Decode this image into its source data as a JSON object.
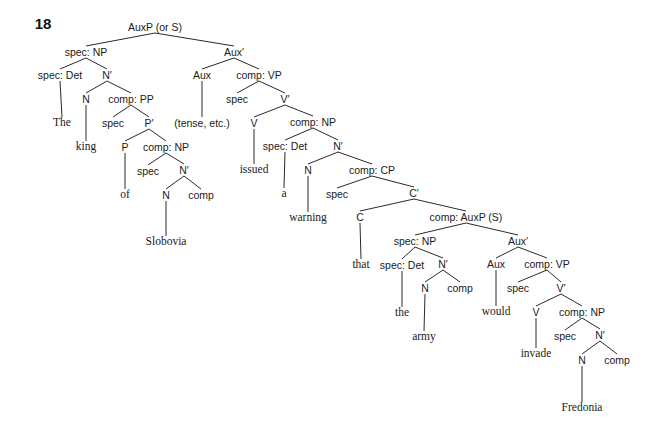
{
  "figure": {
    "number": "18"
  },
  "tree": {
    "nodes": [
      {
        "id": 0,
        "label": "AuxP (or S)",
        "type": "cat",
        "x": 155,
        "y": 27
      },
      {
        "id": 1,
        "label": "spec: NP",
        "type": "cat",
        "x": 86,
        "y": 52
      },
      {
        "id": 2,
        "label": "Aux′",
        "type": "cat",
        "x": 234,
        "y": 52
      },
      {
        "id": 3,
        "label": "spec: Det",
        "type": "cat",
        "x": 60,
        "y": 75
      },
      {
        "id": 4,
        "label": "N′",
        "type": "cat",
        "x": 107,
        "y": 75
      },
      {
        "id": 5,
        "label": "Aux",
        "type": "cat",
        "x": 202,
        "y": 75
      },
      {
        "id": 6,
        "label": "comp: VP",
        "type": "cat",
        "x": 259,
        "y": 75
      },
      {
        "id": 7,
        "label": "The",
        "type": "word",
        "x": 62,
        "y": 123
      },
      {
        "id": 8,
        "label": "N",
        "type": "cat",
        "x": 86,
        "y": 99
      },
      {
        "id": 9,
        "label": "comp: PP",
        "type": "cat",
        "x": 131,
        "y": 99
      },
      {
        "id": 10,
        "label": "(tense, etc.)",
        "type": "cat",
        "x": 202,
        "y": 123
      },
      {
        "id": 11,
        "label": "spec",
        "type": "cat",
        "x": 237,
        "y": 99
      },
      {
        "id": 12,
        "label": "V′",
        "type": "cat",
        "x": 285,
        "y": 99
      },
      {
        "id": 13,
        "label": "king",
        "type": "word",
        "x": 86,
        "y": 147
      },
      {
        "id": 14,
        "label": "spec",
        "type": "cat",
        "x": 113,
        "y": 123
      },
      {
        "id": 15,
        "label": "P′",
        "type": "cat",
        "x": 149,
        "y": 123
      },
      {
        "id": 16,
        "label": "V",
        "type": "cat",
        "x": 254,
        "y": 123
      },
      {
        "id": 17,
        "label": "comp: NP",
        "type": "cat",
        "x": 313,
        "y": 122
      },
      {
        "id": 18,
        "label": "P",
        "type": "cat",
        "x": 125,
        "y": 147
      },
      {
        "id": 19,
        "label": "comp: NP",
        "type": "cat",
        "x": 166,
        "y": 147
      },
      {
        "id": 20,
        "label": "spec: Det",
        "type": "cat",
        "x": 285,
        "y": 146
      },
      {
        "id": 21,
        "label": "N′",
        "type": "cat",
        "x": 338,
        "y": 146
      },
      {
        "id": 22,
        "label": "of",
        "type": "word",
        "x": 125,
        "y": 195
      },
      {
        "id": 23,
        "label": "spec",
        "type": "cat",
        "x": 148,
        "y": 171
      },
      {
        "id": 24,
        "label": "N′",
        "type": "cat",
        "x": 184,
        "y": 170
      },
      {
        "id": 25,
        "label": "issued",
        "type": "word",
        "x": 254,
        "y": 170
      },
      {
        "id": 26,
        "label": "a",
        "type": "word",
        "x": 284,
        "y": 194
      },
      {
        "id": 27,
        "label": "N",
        "type": "cat",
        "x": 308,
        "y": 170
      },
      {
        "id": 28,
        "label": "comp: CP",
        "type": "cat",
        "x": 372,
        "y": 170
      },
      {
        "id": 29,
        "label": "N",
        "type": "cat",
        "x": 166,
        "y": 195
      },
      {
        "id": 30,
        "label": "comp",
        "type": "cat",
        "x": 201,
        "y": 195
      },
      {
        "id": 31,
        "label": "warning",
        "type": "word",
        "x": 308,
        "y": 218
      },
      {
        "id": 32,
        "label": "spec",
        "type": "cat",
        "x": 337,
        "y": 194
      },
      {
        "id": 33,
        "label": "C′",
        "type": "cat",
        "x": 414,
        "y": 193
      },
      {
        "id": 34,
        "label": "Slobovia",
        "type": "word",
        "x": 166,
        "y": 242
      },
      {
        "id": 35,
        "label": "C",
        "type": "cat",
        "x": 360,
        "y": 217
      },
      {
        "id": 36,
        "label": "comp: AuxP (S)",
        "type": "cat",
        "x": 466,
        "y": 217
      },
      {
        "id": 37,
        "label": "that",
        "type": "word",
        "x": 361,
        "y": 265
      },
      {
        "id": 38,
        "label": "spec: NP",
        "type": "cat",
        "x": 415,
        "y": 241
      },
      {
        "id": 39,
        "label": "Aux′",
        "type": "cat",
        "x": 518,
        "y": 241
      },
      {
        "id": 40,
        "label": "spec: Det",
        "type": "cat",
        "x": 402,
        "y": 265
      },
      {
        "id": 41,
        "label": "N′",
        "type": "cat",
        "x": 443,
        "y": 264
      },
      {
        "id": 42,
        "label": "Aux",
        "type": "cat",
        "x": 496,
        "y": 264
      },
      {
        "id": 43,
        "label": "comp: VP",
        "type": "cat",
        "x": 547,
        "y": 264
      },
      {
        "id": 44,
        "label": "the",
        "type": "word",
        "x": 402,
        "y": 313
      },
      {
        "id": 45,
        "label": "N",
        "type": "cat",
        "x": 425,
        "y": 288
      },
      {
        "id": 46,
        "label": "comp",
        "type": "cat",
        "x": 460,
        "y": 288
      },
      {
        "id": 47,
        "label": "would",
        "type": "word",
        "x": 496,
        "y": 312
      },
      {
        "id": 48,
        "label": "spec",
        "type": "cat",
        "x": 518,
        "y": 288
      },
      {
        "id": 49,
        "label": "V′",
        "type": "cat",
        "x": 561,
        "y": 288
      },
      {
        "id": 50,
        "label": "army",
        "type": "word",
        "x": 424,
        "y": 337
      },
      {
        "id": 51,
        "label": "V",
        "type": "cat",
        "x": 536,
        "y": 312
      },
      {
        "id": 52,
        "label": "comp: NP",
        "type": "cat",
        "x": 582,
        "y": 312
      },
      {
        "id": 53,
        "label": "invade",
        "type": "word",
        "x": 536,
        "y": 354
      },
      {
        "id": 54,
        "label": "spec",
        "type": "cat",
        "x": 565,
        "y": 336
      },
      {
        "id": 55,
        "label": "N′",
        "type": "cat",
        "x": 600,
        "y": 335
      },
      {
        "id": 56,
        "label": "N",
        "type": "cat",
        "x": 582,
        "y": 360
      },
      {
        "id": 57,
        "label": "comp",
        "type": "cat",
        "x": 617,
        "y": 360
      },
      {
        "id": 58,
        "label": "Fredonia",
        "type": "word",
        "x": 582,
        "y": 408
      }
    ],
    "edges": [
      [
        0,
        1
      ],
      [
        0,
        2
      ],
      [
        1,
        3
      ],
      [
        1,
        4
      ],
      [
        2,
        5
      ],
      [
        2,
        6
      ],
      [
        3,
        7
      ],
      [
        4,
        8
      ],
      [
        4,
        9
      ],
      [
        5,
        10
      ],
      [
        6,
        11
      ],
      [
        6,
        12
      ],
      [
        8,
        13
      ],
      [
        9,
        14
      ],
      [
        9,
        15
      ],
      [
        12,
        16
      ],
      [
        12,
        17
      ],
      [
        15,
        18
      ],
      [
        15,
        19
      ],
      [
        17,
        20
      ],
      [
        17,
        21
      ],
      [
        18,
        22
      ],
      [
        19,
        23
      ],
      [
        19,
        24
      ],
      [
        16,
        25
      ],
      [
        20,
        26
      ],
      [
        21,
        27
      ],
      [
        21,
        28
      ],
      [
        24,
        29
      ],
      [
        24,
        30
      ],
      [
        27,
        31
      ],
      [
        28,
        32
      ],
      [
        28,
        33
      ],
      [
        29,
        34
      ],
      [
        33,
        35
      ],
      [
        33,
        36
      ],
      [
        35,
        37
      ],
      [
        36,
        38
      ],
      [
        36,
        39
      ],
      [
        38,
        40
      ],
      [
        38,
        41
      ],
      [
        39,
        42
      ],
      [
        39,
        43
      ],
      [
        40,
        44
      ],
      [
        41,
        45
      ],
      [
        41,
        46
      ],
      [
        42,
        47
      ],
      [
        43,
        48
      ],
      [
        43,
        49
      ],
      [
        45,
        50
      ],
      [
        49,
        51
      ],
      [
        49,
        52
      ],
      [
        51,
        53
      ],
      [
        52,
        54
      ],
      [
        52,
        55
      ],
      [
        55,
        56
      ],
      [
        55,
        57
      ],
      [
        56,
        58
      ]
    ]
  },
  "words": [
    "The",
    "king",
    "of",
    "Slobovia",
    "issued",
    "a",
    "warning",
    "that",
    "the",
    "army",
    "would",
    "invade",
    "Fredonia"
  ]
}
